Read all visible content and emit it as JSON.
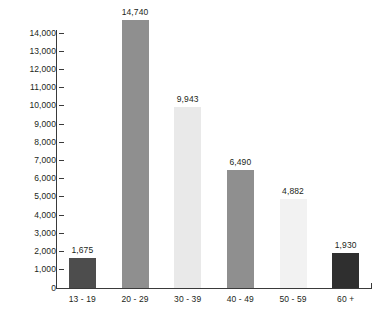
{
  "chart_data": {
    "type": "bar",
    "title": "",
    "subtitle": "",
    "xlabel": "",
    "ylabel": "",
    "categories": [
      "13 - 19",
      "20 - 29",
      "30 - 39",
      "40 - 49",
      "50 - 59",
      "60 +"
    ],
    "values": [
      1675,
      14740,
      9943,
      6490,
      4882,
      1930
    ],
    "value_labels": [
      "1,675",
      "14,740",
      "9,943",
      "6,490",
      "4,882",
      "1,930"
    ],
    "bar_colors": [
      "#4d4d4d",
      "#8f8f8f",
      "#e9e9e9",
      "#8f8f8f",
      "#f2f2f2",
      "#2f2f2f"
    ],
    "ylim": [
      0,
      14000
    ],
    "ytick_values": [
      0,
      1000,
      2000,
      3000,
      4000,
      5000,
      6000,
      7000,
      8000,
      9000,
      10000,
      11000,
      12000,
      13000,
      14000
    ],
    "ytick_labels": [
      "0",
      "1,000",
      "2,000",
      "3,000",
      "4,000",
      "5,000",
      "6,000",
      "7,000",
      "8,000",
      "9,000",
      "10,000",
      "11,000",
      "12,000",
      "13,000",
      "14,000"
    ],
    "grid": false,
    "legend": "none",
    "axis_color": "#3a3a3a",
    "text_color": "#231f20",
    "background": "#ffffff",
    "data_labels_shown": true
  }
}
